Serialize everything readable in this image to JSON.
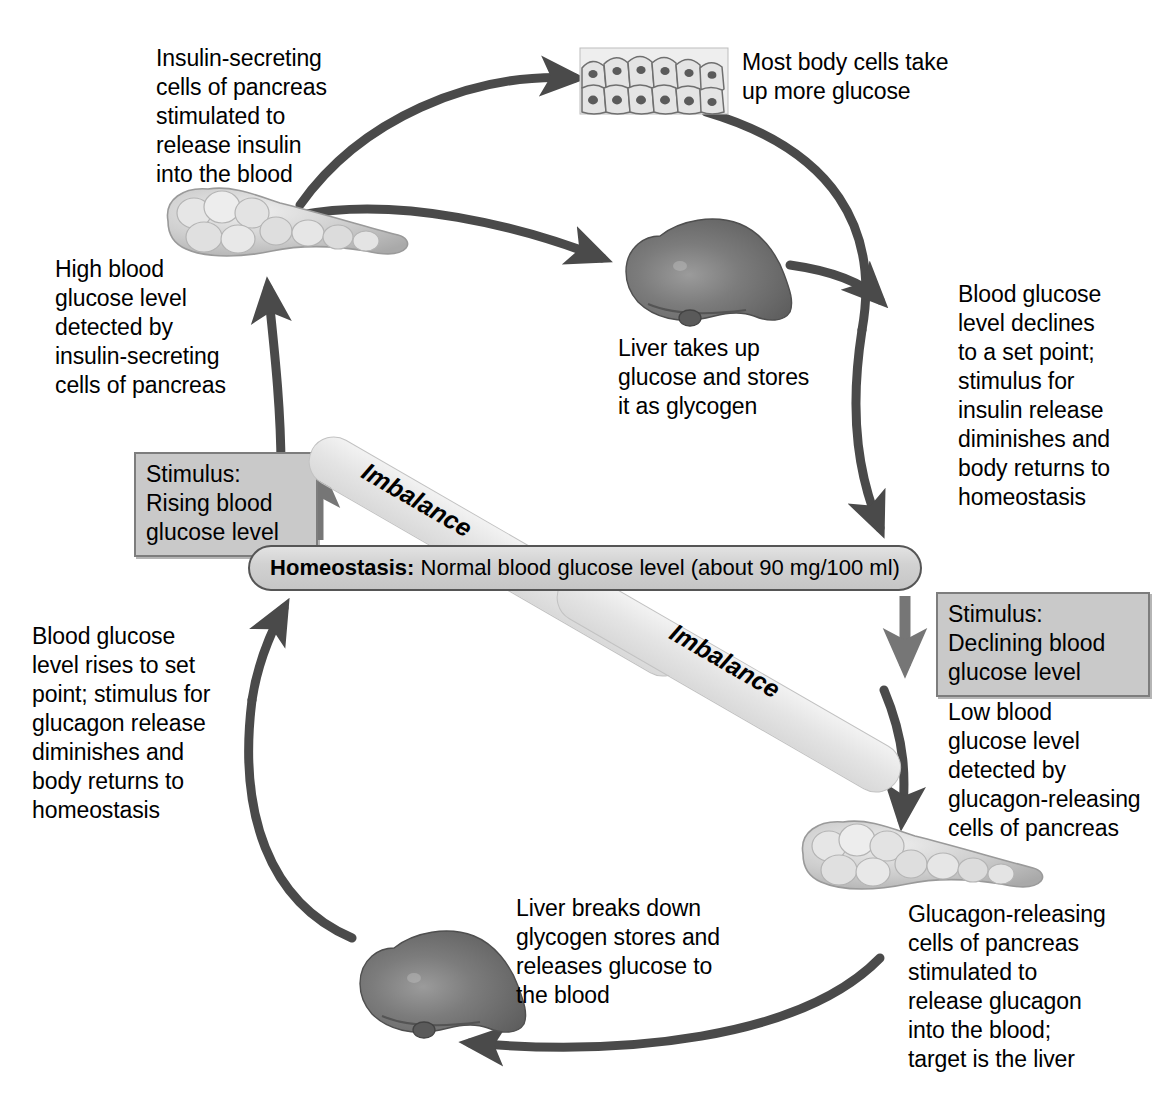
{
  "diagram": {
    "center_bar": {
      "bold_label": "Homeostasis:",
      "rest": " Normal blood glucose level (about 90 mg/100 ml)"
    },
    "imbalance_upper_label": "Imbalance",
    "imbalance_lower_label": "Imbalance",
    "stimulus_rising": "Stimulus:\nRising blood\nglucose level",
    "stimulus_declining": "Stimulus:\nDeclining blood\nglucose level",
    "labels": {
      "insulin_secreting": "Insulin-secreting\ncells of pancreas\nstimulated to\nrelease insulin\ninto the blood",
      "body_cells": "Most body cells take\nup more glucose",
      "high_blood_glucose": "High blood\nglucose level\ndetected by\ninsulin-secreting\ncells of pancreas",
      "liver_takes_up": "Liver takes up\nglucose and stores\nit as glycogen",
      "blood_glucose_declines": "Blood glucose\nlevel declines\nto a set point;\nstimulus for\ninsulin release\ndiminishes and\nbody returns to\nhomeostasis",
      "blood_glucose_rises": "Blood glucose\nlevel rises to set\npoint; stimulus for\nglucagon release\ndiminishes and\nbody returns to\nhomeostasis",
      "low_blood_glucose": "Low blood\nglucose level\ndetected by\nglucagon-releasing\ncells of pancreas",
      "glucagon_releasing": "Glucagon-releasing\ncells of pancreas\nstimulated to\nrelease glucagon\ninto the blood;\ntarget is the liver",
      "liver_breaks_down": "Liver breaks down\nglycogen stores and\nreleases glucose to\nthe blood"
    },
    "organs": {
      "pancreas_top": "pancreas-illustration",
      "pancreas_bottom": "pancreas-illustration",
      "liver_top": "liver-illustration",
      "liver_bottom": "liver-illustration",
      "body_cells_tissue": "epithelial-tissue-illustration"
    },
    "colors": {
      "arrow": "#4a4a4a",
      "stimulus_box_fill": "#c9c9c9",
      "stimulus_box_border": "#7d7d7d",
      "homeostasis_fill": "#d4d4d4",
      "homeostasis_border": "#555555",
      "imbalance_band": "#e4e4e4",
      "liver": "#6e6e6e",
      "pancreas": "#c0c0c0",
      "text": "#000000"
    }
  }
}
